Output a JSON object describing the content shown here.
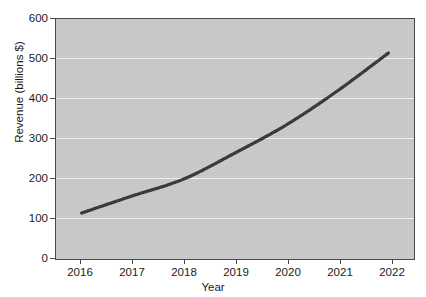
{
  "chart_data": {
    "type": "line",
    "title": "",
    "xlabel": "Year",
    "ylabel": "Revenue (billions $)",
    "x": [
      2016,
      2017,
      2018,
      2019,
      2020,
      2021,
      2022
    ],
    "categories": [
      "2016",
      "2017",
      "2018",
      "2019",
      "2020",
      "2021",
      "2022"
    ],
    "values": [
      115,
      158,
      200,
      265,
      335,
      420,
      515
    ],
    "series": [
      {
        "name": "Revenue",
        "values": [
          115,
          158,
          200,
          265,
          335,
          420,
          515
        ]
      }
    ],
    "xtick_labels": [
      "2016",
      "2017",
      "2018",
      "2019",
      "2020",
      "2021",
      "2022"
    ],
    "ytick_labels": [
      "0",
      "100",
      "200",
      "300",
      "400",
      "500",
      "600"
    ],
    "ytick_values": [
      0,
      100,
      200,
      300,
      400,
      500,
      600
    ],
    "ylim": [
      0,
      600
    ],
    "xlim": [
      2015.5,
      2022.5
    ],
    "grid": "horizontal",
    "legend": "none",
    "line_color": "#333333",
    "panel_color": "#c9c9c9",
    "gridline_color": "#f3f3f3",
    "figure_background": "#ffffff"
  }
}
